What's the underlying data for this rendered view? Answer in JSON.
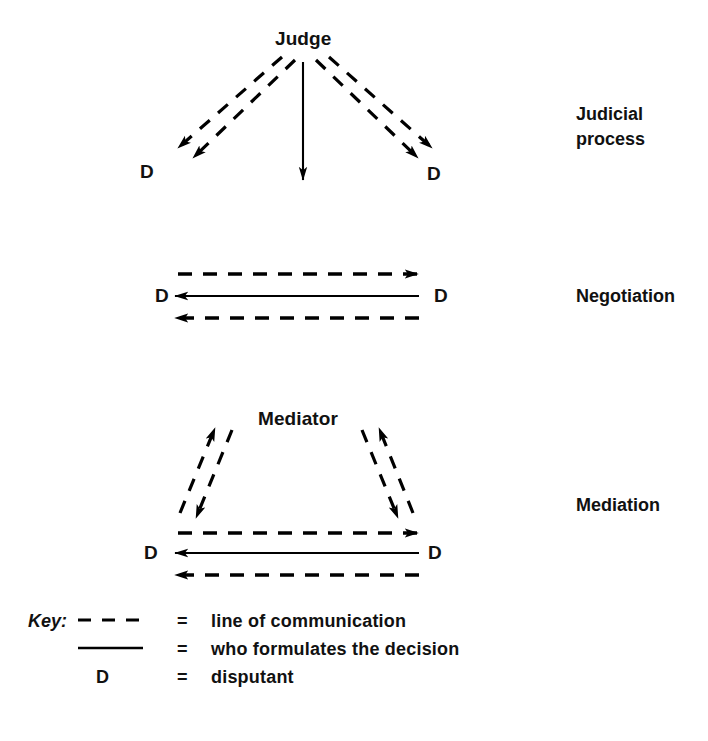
{
  "figure": {
    "type": "diagram",
    "title_visible": false,
    "background": "#ffffff",
    "ink": "#000000"
  },
  "sections": [
    {
      "id": "judicial",
      "label": "Judicial\nprocess",
      "label_line1": "Judicial",
      "label_line2": "process",
      "center_node": "Judge",
      "left_disputant": "D",
      "right_disputant": "D",
      "description": "Judge communicates with both disputants via dashed lines; judge formulates the decision (solid arrow downward)."
    },
    {
      "id": "negotiation",
      "label": "Negotiation",
      "left_disputant": "D",
      "right_disputant": "D",
      "description": "Two disputants communicate directly via dashed lines in both directions; the disputants formulate the decision (solid line)."
    },
    {
      "id": "mediation",
      "label": "Mediation",
      "center_node": "Mediator",
      "left_disputant": "D",
      "right_disputant": "D",
      "description": "Mediator exchanges communication with both disputants and disputants communicate directly; disputants formulate the decision."
    }
  ],
  "key": {
    "title": "Key:",
    "rows": [
      {
        "symbol": "dashed-line",
        "equals": "=",
        "definition": "line of communication"
      },
      {
        "symbol": "solid-line",
        "equals": "=",
        "definition": "who formulates the decision"
      },
      {
        "symbol": "D",
        "equals": "=",
        "definition": "disputant"
      }
    ]
  }
}
